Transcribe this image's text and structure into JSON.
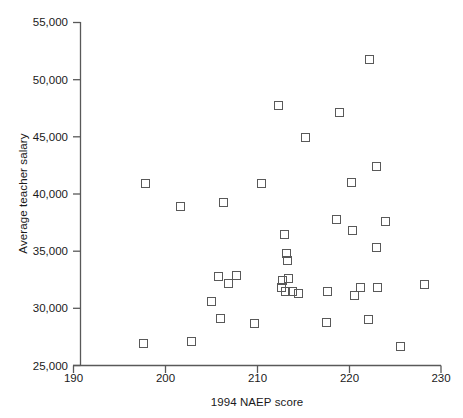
{
  "chart_data": {
    "type": "scatter",
    "title": "",
    "xlabel": "1994 NAEP score",
    "ylabel": "Average teacher salary",
    "xlim": [
      190,
      230
    ],
    "ylim": [
      25000,
      55000
    ],
    "xticks": [
      "190",
      "200",
      "210",
      "220",
      "230"
    ],
    "xtick_values": [
      190,
      200,
      210,
      220,
      230
    ],
    "yticks": [
      "25,000",
      "30,000",
      "35,000",
      "40,000",
      "45,000",
      "50,000",
      "55,000"
    ],
    "ytick_values": [
      25000,
      30000,
      35000,
      40000,
      45000,
      50000,
      55000
    ],
    "grid": false,
    "legend": null,
    "marker": "open-square",
    "marker_color": "#595959",
    "points": [
      {
        "x": 197.8,
        "y": 40900
      },
      {
        "x": 197.6,
        "y": 26900
      },
      {
        "x": 201.6,
        "y": 38900
      },
      {
        "x": 202.8,
        "y": 27100
      },
      {
        "x": 205.0,
        "y": 30600
      },
      {
        "x": 205.8,
        "y": 32800
      },
      {
        "x": 206.0,
        "y": 29100
      },
      {
        "x": 206.3,
        "y": 39300
      },
      {
        "x": 206.9,
        "y": 32200
      },
      {
        "x": 207.7,
        "y": 32900
      },
      {
        "x": 209.7,
        "y": 28700
      },
      {
        "x": 210.5,
        "y": 40900
      },
      {
        "x": 212.3,
        "y": 47700
      },
      {
        "x": 213.0,
        "y": 36500
      },
      {
        "x": 213.2,
        "y": 34800
      },
      {
        "x": 213.3,
        "y": 34200
      },
      {
        "x": 212.7,
        "y": 32400
      },
      {
        "x": 213.4,
        "y": 32600
      },
      {
        "x": 212.6,
        "y": 31800
      },
      {
        "x": 213.1,
        "y": 31500
      },
      {
        "x": 213.8,
        "y": 31500
      },
      {
        "x": 214.5,
        "y": 31300
      },
      {
        "x": 215.2,
        "y": 44900
      },
      {
        "x": 217.6,
        "y": 31500
      },
      {
        "x": 217.5,
        "y": 28800
      },
      {
        "x": 218.6,
        "y": 37800
      },
      {
        "x": 219.0,
        "y": 47100
      },
      {
        "x": 220.3,
        "y": 41000
      },
      {
        "x": 220.4,
        "y": 36800
      },
      {
        "x": 220.6,
        "y": 31100
      },
      {
        "x": 221.2,
        "y": 31800
      },
      {
        "x": 222.2,
        "y": 51800
      },
      {
        "x": 222.1,
        "y": 29000
      },
      {
        "x": 223.0,
        "y": 42400
      },
      {
        "x": 223.0,
        "y": 35300
      },
      {
        "x": 223.1,
        "y": 31800
      },
      {
        "x": 224.0,
        "y": 37600
      },
      {
        "x": 225.6,
        "y": 26700
      },
      {
        "x": 228.2,
        "y": 32100
      }
    ]
  }
}
